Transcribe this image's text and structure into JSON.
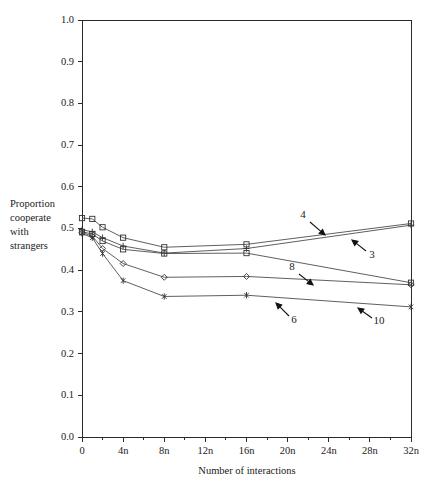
{
  "chart_data": {
    "type": "line",
    "title": "",
    "xlabel": "Number of interactions",
    "ylabel": "Proportion cooperate with strangers",
    "ylabel_lines": [
      "Proportion",
      "cooperate",
      "with",
      "strangers"
    ],
    "xlim": [
      0,
      32
    ],
    "ylim": [
      0.0,
      1.0
    ],
    "grid": false,
    "legend_position": "inline-annotations",
    "xtick_labels": [
      "0",
      "4n",
      "8n",
      "12n",
      "16n",
      "20n",
      "24n",
      "28n",
      "32n"
    ],
    "xtick_values": [
      0,
      4,
      8,
      12,
      16,
      20,
      24,
      28,
      32
    ],
    "xminor_tick_values": [
      2,
      6,
      10,
      14,
      18,
      22,
      26,
      30
    ],
    "ytick_labels": [
      "0.0",
      "0.1",
      "0.2",
      "0.3",
      "0.4",
      "0.5",
      "0.6",
      "0.7",
      "0.8",
      "0.9",
      "1.0"
    ],
    "ytick_values": [
      0.0,
      0.1,
      0.2,
      0.3,
      0.4,
      0.5,
      0.6,
      0.7,
      0.8,
      0.9,
      1.0
    ],
    "series": [
      {
        "name": "3",
        "marker": "square",
        "x": [
          0,
          1,
          2,
          4,
          8,
          16,
          32
        ],
        "values": [
          0.525,
          0.523,
          0.503,
          0.478,
          0.455,
          0.462,
          0.512
        ]
      },
      {
        "name": "4",
        "marker": "plus",
        "x": [
          0,
          1,
          2,
          4,
          8,
          16,
          32
        ],
        "values": [
          0.497,
          0.492,
          0.478,
          0.458,
          0.441,
          0.452,
          0.508
        ]
      },
      {
        "name": "8",
        "marker": "square",
        "x": [
          0,
          1,
          2,
          4,
          8,
          16,
          32
        ],
        "values": [
          0.492,
          0.487,
          0.47,
          0.45,
          0.44,
          0.441,
          0.37
        ]
      },
      {
        "name": "6",
        "marker": "diamond",
        "x": [
          0,
          1,
          2,
          4,
          8,
          16,
          32
        ],
        "values": [
          0.49,
          0.482,
          0.452,
          0.416,
          0.383,
          0.385,
          0.365
        ]
      },
      {
        "name": "10",
        "marker": "asterisk",
        "x": [
          0,
          1,
          2,
          4,
          8,
          16,
          32
        ],
        "values": [
          0.488,
          0.478,
          0.44,
          0.375,
          0.337,
          0.34,
          0.312
        ]
      }
    ],
    "annotations": [
      {
        "label": "4",
        "x": 303,
        "y": 218,
        "arrow": {
          "x1": 310,
          "y1": 222,
          "x2": 325,
          "y2": 235
        }
      },
      {
        "label": "3",
        "x": 372,
        "y": 258,
        "arrow": {
          "x1": 366,
          "y1": 251,
          "x2": 352,
          "y2": 240
        }
      },
      {
        "label": "8",
        "x": 292,
        "y": 270,
        "arrow": {
          "x1": 299,
          "y1": 274,
          "x2": 313,
          "y2": 285
        }
      },
      {
        "label": "6",
        "x": 294,
        "y": 323,
        "arrow": {
          "x1": 289,
          "y1": 316,
          "x2": 276,
          "y2": 303
        }
      },
      {
        "label": "10",
        "x": 379,
        "y": 324,
        "arrow": {
          "x1": 372,
          "y1": 318,
          "x2": 358,
          "y2": 308
        }
      }
    ],
    "colors": {
      "axis": "#2b2b2b",
      "line": "#4d4d4d",
      "marker": "#333333",
      "text": "#1a1a1a",
      "background": "#ffffff"
    }
  },
  "figure": {
    "plot_area": {
      "left": 82,
      "top": 20,
      "right": 411,
      "bottom": 437
    }
  }
}
